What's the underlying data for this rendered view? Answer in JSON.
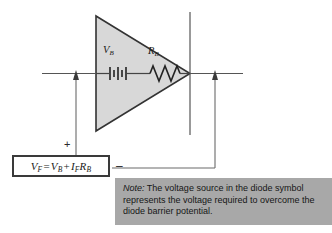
{
  "figure": {
    "type": "circuit-diagram",
    "background_color": "#ffffff"
  },
  "diode": {
    "symbol_name": "diode-triangle",
    "fill_color": "#d8d8d8",
    "outline_color": "#333333",
    "components": [
      {
        "name": "barrier-potential-source",
        "symbol": "battery",
        "label": "V",
        "subscript": "B"
      },
      {
        "name": "dynamic-resistance",
        "symbol": "resistor",
        "label": "R",
        "subscript": "B"
      }
    ],
    "cathode_bar_name": "cathode-bar"
  },
  "wires": {
    "left_terminal": "anode-wire",
    "right_terminal": "cathode-wire",
    "measurement_left": "voltage-probe-left",
    "measurement_right": "voltage-probe-right"
  },
  "polarity": {
    "positive": "+",
    "negative": "–"
  },
  "equation": {
    "name": "forward-voltage-equation",
    "lhs_symbol": "V",
    "lhs_sub": "F",
    "equals": "=",
    "term1_symbol": "V",
    "term1_sub": "B",
    "plus": "+",
    "term2a_symbol": "I",
    "term2a_sub": "F",
    "term2b_symbol": "R",
    "term2b_sub": "B",
    "plain_text": "VF = VB + IFRB"
  },
  "note": {
    "name": "explanatory-note",
    "lead": "Note:",
    "body": " The voltage source in the diode symbol represents the voltage required to overcome the diode barrier potential.",
    "background_color": "#a8a8a8"
  }
}
